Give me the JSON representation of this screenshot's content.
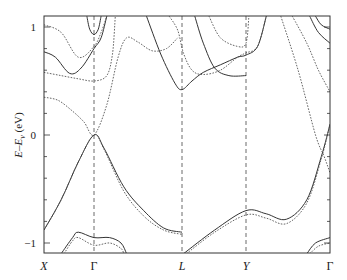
{
  "chart_data": {
    "type": "line",
    "title": "",
    "xlabel": "",
    "ylabel": "E–E_v (eV)",
    "ylabel_parts": {
      "main": "E–E",
      "sub": "v",
      "unit": " (eV)"
    },
    "ylim": [
      -1.1,
      1.1
    ],
    "yticks": [
      -1,
      0,
      1
    ],
    "ytick_labels": [
      "−1",
      "0",
      "1"
    ],
    "yminor_step": 0.2,
    "grid": false,
    "legend": null,
    "kpoints": [
      {
        "label": "X",
        "pos": 0.0
      },
      {
        "label": "Γ",
        "pos": 0.175
      },
      {
        "label": "L",
        "pos": 0.485
      },
      {
        "label": "Y",
        "pos": 0.71
      },
      {
        "label": "Γ",
        "pos": 1.0
      }
    ],
    "series": [
      {
        "name": "valence-top-solid",
        "style": "solid",
        "points": [
          [
            0,
            -0.88
          ],
          [
            0.06,
            -0.6
          ],
          [
            0.12,
            -0.25
          ],
          [
            0.175,
            0.0
          ],
          [
            0.21,
            -0.12
          ],
          [
            0.28,
            -0.48
          ],
          [
            0.35,
            -0.7
          ],
          [
            0.42,
            -0.86
          ],
          [
            0.485,
            -0.9
          ]
        ]
      },
      {
        "name": "valence-top-dotted",
        "style": "dotted",
        "points": [
          [
            0,
            -0.88
          ],
          [
            0.06,
            -0.6
          ],
          [
            0.12,
            -0.25
          ],
          [
            0.175,
            0.0
          ],
          [
            0.21,
            -0.13
          ],
          [
            0.28,
            -0.52
          ],
          [
            0.35,
            -0.75
          ],
          [
            0.42,
            -0.88
          ],
          [
            0.485,
            -0.92
          ]
        ]
      },
      {
        "name": "valence-YG-solid",
        "style": "solid",
        "points": [
          [
            0.49,
            -1.1
          ],
          [
            0.6,
            -0.88
          ],
          [
            0.71,
            -0.7
          ],
          [
            0.78,
            -0.73
          ],
          [
            0.85,
            -0.78
          ],
          [
            0.92,
            -0.6
          ],
          [
            0.97,
            -0.2
          ],
          [
            1.0,
            0.1
          ]
        ]
      },
      {
        "name": "valence-YG-dotted",
        "style": "dotted",
        "points": [
          [
            0.5,
            -1.1
          ],
          [
            0.6,
            -0.9
          ],
          [
            0.71,
            -0.74
          ],
          [
            0.78,
            -0.77
          ],
          [
            0.85,
            -0.82
          ],
          [
            0.92,
            -0.63
          ],
          [
            0.97,
            -0.22
          ],
          [
            1.0,
            0.1
          ]
        ]
      },
      {
        "name": "valence-low-solid",
        "style": "solid",
        "points": [
          [
            0.06,
            -1.1
          ],
          [
            0.1,
            -0.95
          ],
          [
            0.12,
            -0.9
          ],
          [
            0.175,
            -0.95
          ],
          [
            0.23,
            -0.95
          ],
          [
            0.27,
            -1.0
          ],
          [
            0.29,
            -1.1
          ]
        ]
      },
      {
        "name": "valence-low-dotted",
        "style": "dotted",
        "points": [
          [
            0.07,
            -1.1
          ],
          [
            0.1,
            -0.98
          ],
          [
            0.12,
            -0.95
          ],
          [
            0.175,
            -1.02
          ],
          [
            0.23,
            -1.0
          ],
          [
            0.27,
            -1.05
          ],
          [
            0.28,
            -1.1
          ]
        ]
      },
      {
        "name": "valence-low-right-solid",
        "style": "solid",
        "points": [
          [
            0.92,
            -1.1
          ],
          [
            0.95,
            -1.0
          ],
          [
            1.0,
            -0.95
          ]
        ]
      },
      {
        "name": "valence-low-right-dotted",
        "style": "dotted",
        "points": [
          [
            0.93,
            -1.1
          ],
          [
            0.96,
            -1.03
          ],
          [
            1.0,
            -1.0
          ]
        ]
      },
      {
        "name": "conduction-1-solid",
        "style": "solid",
        "points": [
          [
            0,
            0.77
          ],
          [
            0.04,
            0.72
          ],
          [
            0.09,
            0.57
          ],
          [
            0.13,
            0.62
          ],
          [
            0.175,
            0.8
          ],
          [
            0.2,
            0.9
          ],
          [
            0.22,
            1.1
          ]
        ]
      },
      {
        "name": "conduction-1b-solid",
        "style": "solid",
        "points": [
          [
            0.15,
            1.1
          ],
          [
            0.16,
            0.98
          ],
          [
            0.175,
            0.93
          ],
          [
            0.19,
            0.98
          ],
          [
            0.2,
            1.1
          ]
        ]
      },
      {
        "name": "conduction-1-dotted",
        "style": "dotted",
        "points": [
          [
            0,
            1.02
          ],
          [
            0.06,
            0.95
          ],
          [
            0.12,
            0.72
          ],
          [
            0.175,
            0.82
          ],
          [
            0.2,
            0.95
          ],
          [
            0.22,
            1.1
          ]
        ]
      },
      {
        "name": "conduction-2-dotted",
        "style": "dotted",
        "points": [
          [
            0,
            0.35
          ],
          [
            0.05,
            0.32
          ],
          [
            0.1,
            0.22
          ],
          [
            0.14,
            0.12
          ],
          [
            0.175,
            0.0
          ],
          [
            0.22,
            0.28
          ],
          [
            0.26,
            0.72
          ],
          [
            0.29,
            0.9
          ],
          [
            0.33,
            0.86
          ],
          [
            0.38,
            0.78
          ],
          [
            0.43,
            0.8
          ],
          [
            0.47,
            0.9
          ]
        ]
      },
      {
        "name": "conduction-3-dotted",
        "style": "dotted",
        "points": [
          [
            0,
            0.58
          ],
          [
            0.06,
            0.55
          ],
          [
            0.12,
            0.52
          ],
          [
            0.175,
            0.5
          ],
          [
            0.22,
            0.55
          ],
          [
            0.24,
            0.75
          ],
          [
            0.25,
            1.1
          ]
        ]
      },
      {
        "name": "conduction-L-solid",
        "style": "solid",
        "points": [
          [
            0.36,
            1.1
          ],
          [
            0.41,
            0.75
          ],
          [
            0.46,
            0.48
          ],
          [
            0.485,
            0.42
          ],
          [
            0.52,
            0.5
          ],
          [
            0.56,
            0.58
          ],
          [
            0.62,
            0.65
          ],
          [
            0.68,
            0.72
          ],
          [
            0.71,
            0.74
          ],
          [
            0.75,
            0.82
          ],
          [
            0.78,
            1.1
          ]
        ]
      },
      {
        "name": "conduction-L2-solid",
        "style": "solid",
        "points": [
          [
            0.53,
            1.1
          ],
          [
            0.56,
            0.85
          ],
          [
            0.6,
            0.62
          ],
          [
            0.65,
            0.55
          ],
          [
            0.71,
            0.55
          ]
        ]
      },
      {
        "name": "conduction-L-dotted",
        "style": "dotted",
        "points": [
          [
            0.44,
            1.1
          ],
          [
            0.47,
            0.97
          ],
          [
            0.49,
            0.76
          ],
          [
            0.52,
            0.6
          ],
          [
            0.56,
            0.56
          ],
          [
            0.62,
            0.6
          ],
          [
            0.68,
            0.72
          ],
          [
            0.71,
            0.76
          ],
          [
            0.75,
            0.82
          ],
          [
            0.78,
            1.1
          ]
        ]
      },
      {
        "name": "conduction-Y-dotted",
        "style": "dotted",
        "points": [
          [
            0.58,
            1.1
          ],
          [
            0.62,
            0.9
          ],
          [
            0.68,
            0.82
          ],
          [
            0.71,
            0.85
          ],
          [
            0.72,
            1.1
          ]
        ]
      },
      {
        "name": "conduction-right-dotted-1",
        "style": "dotted",
        "points": [
          [
            0.83,
            1.1
          ],
          [
            0.89,
            0.6
          ],
          [
            0.95,
            0.0
          ],
          [
            0.98,
            -0.2
          ],
          [
            1.0,
            -0.35
          ]
        ]
      },
      {
        "name": "conduction-right-dotted-2",
        "style": "dotted",
        "points": [
          [
            0.87,
            1.1
          ],
          [
            0.92,
            0.85
          ],
          [
            0.96,
            0.6
          ],
          [
            1.0,
            0.4
          ]
        ]
      },
      {
        "name": "conduction-right-solid-1",
        "style": "solid",
        "points": [
          [
            0.93,
            1.1
          ],
          [
            0.96,
            0.95
          ],
          [
            1.0,
            0.85
          ]
        ]
      },
      {
        "name": "conduction-right-solid-2",
        "style": "solid",
        "points": [
          [
            0.95,
            1.1
          ],
          [
            0.97,
            1.02
          ],
          [
            1.0,
            0.98
          ]
        ]
      }
    ]
  },
  "axes": {
    "ytick_labels": {
      "top": "1",
      "mid": "0",
      "bottom": "−1"
    },
    "kpoint_labels": {
      "X": "X",
      "G1": "Γ",
      "L": "L",
      "Y": "Y",
      "G2": "Γ"
    }
  }
}
